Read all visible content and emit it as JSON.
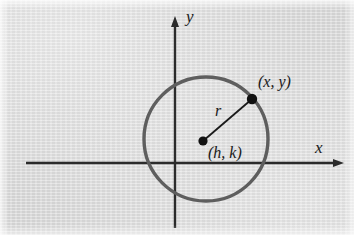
{
  "figure": {
    "name": "circle-center-radius-diagram",
    "background_color": "#d8d8d8",
    "axis_color": "#2b2b2b",
    "circle_color": "#5e5e5e",
    "point_color": "#111111",
    "radius_line_color": "#1a1a1a"
  },
  "axes": {
    "x_label": "x",
    "y_label": "y",
    "origin": {
      "x": 175,
      "y": 163
    },
    "x_axis": {
      "start_x": 26,
      "end_x": 341,
      "y": 163,
      "arrow": "right"
    },
    "y_axis": {
      "x": 175,
      "start_y": 228,
      "end_y": 18,
      "arrow": "up"
    }
  },
  "circle": {
    "center": {
      "x": 206,
      "y": 139
    },
    "radius": 62,
    "stroke_width": 3.4
  },
  "points": [
    {
      "name": "center-point",
      "label": "(h, k)",
      "x": 203,
      "y": 141,
      "dot_radius": 4.6
    },
    {
      "name": "circle-point",
      "label": "(x, y)",
      "x": 252,
      "y": 99,
      "dot_radius": 5.2
    }
  ],
  "radius_segment": {
    "label": "r",
    "from": {
      "x": 203,
      "y": 141
    },
    "to": {
      "x": 252,
      "y": 99
    },
    "stroke_width": 1.8
  }
}
